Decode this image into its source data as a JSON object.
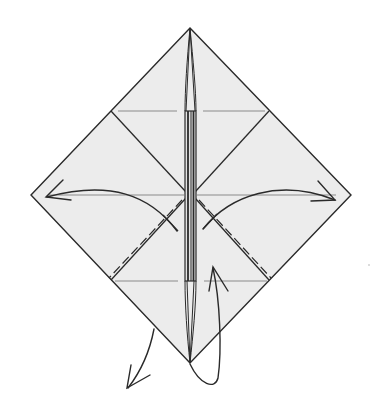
{
  "diagram": {
    "type": "origami-step",
    "colors": {
      "paper": "#ececec",
      "line": "#2a2a2a",
      "crease": "#8a8a8a",
      "background": "#ffffff"
    },
    "elements": {
      "outline": "diamond-paper",
      "center_strip": "vertical-folded-flap",
      "arrows": [
        "fold-left-arrow",
        "fold-right-arrow",
        "swing-down-left-arrow",
        "turn-over-arrow"
      ],
      "fold_lines": [
        "dashed-lower-left",
        "dashed-lower-right"
      ],
      "creases": [
        "upper-horizontal-crease",
        "lower-horizontal-crease",
        "center-horizontal-crease"
      ]
    }
  }
}
